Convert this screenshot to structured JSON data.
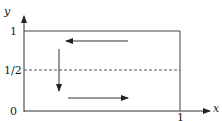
{
  "diagram": {
    "axes": {
      "x_label": "x",
      "y_label": "y",
      "x_ticks": [
        {
          "value": 1,
          "label": "1"
        }
      ],
      "y_ticks": [
        {
          "value": 0,
          "label": "0"
        },
        {
          "value": 0.5,
          "label": "1/2"
        },
        {
          "value": 1,
          "label": "1"
        }
      ]
    },
    "region": {
      "x_range": [
        0,
        1
      ],
      "y_range": [
        0,
        1
      ],
      "shape": "unit square"
    },
    "dashed_line": {
      "y": 0.5,
      "label": "1/2"
    },
    "flow_arrows": [
      {
        "name": "top-leftward",
        "direction": "left",
        "near_y": 0.85
      },
      {
        "name": "left-downward",
        "direction": "down",
        "near_x": 0.25
      },
      {
        "name": "bottom-rightward",
        "direction": "right",
        "near_y": 0.15
      }
    ],
    "colors": {
      "stroke": "#333333",
      "dashed": "#555555",
      "background": "#ffffff"
    }
  }
}
